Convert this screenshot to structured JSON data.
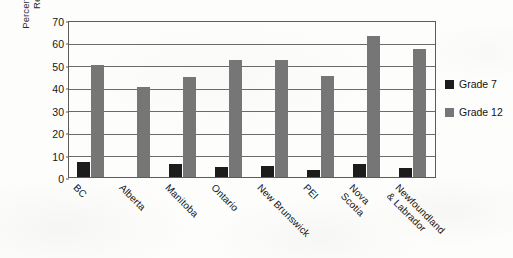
{
  "chart_data": {
    "type": "bar",
    "title": "",
    "xlabel": "",
    "ylabel": "Percentage of Students\nReporting Use",
    "ylim": [
      0,
      70
    ],
    "ytick_step": 10,
    "yticks": [
      0,
      10,
      20,
      30,
      40,
      50,
      60,
      70
    ],
    "grid": true,
    "legend_position": "right",
    "categories": [
      "BC",
      "Alberta",
      "Manitoba",
      "Ontario",
      "New Brunswick",
      "PEI",
      "Nova\nScotia",
      "Newfoundland\n& Labrador"
    ],
    "series": [
      {
        "name": "Grade 7",
        "color": "#1c1c1c",
        "values": [
          6.5,
          0,
          6,
          4.5,
          5,
          3,
          6,
          4
        ]
      },
      {
        "name": "Grade 12",
        "color": "#767676",
        "values": [
          50,
          40,
          44.5,
          52,
          52,
          45,
          63,
          57
        ]
      }
    ]
  },
  "legend": {
    "items": [
      {
        "label": "Grade 7",
        "color": "#1c1c1c"
      },
      {
        "label": "Grade 12",
        "color": "#767676"
      }
    ]
  },
  "colors": {
    "grade7": "#1c1c1c",
    "grade12": "#767676",
    "axis": "#5b5b5b",
    "grid": "#6a6a6a",
    "background": "#fdfdfc"
  }
}
